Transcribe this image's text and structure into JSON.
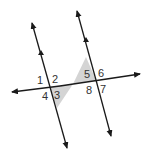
{
  "diagram": {
    "angle_labels": {
      "a1": "1",
      "a2": "2",
      "a3": "3",
      "a4": "4",
      "a5": "5",
      "a6": "6",
      "a7": "7",
      "a8": "8"
    },
    "colors": {
      "line": "#1a1a1a",
      "shade": "#d4d4d4",
      "label": "#333333"
    }
  }
}
